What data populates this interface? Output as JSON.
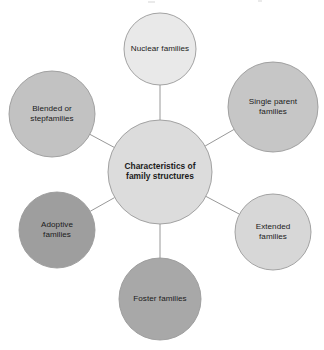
{
  "diagram": {
    "type": "radial-hub-and-spoke",
    "background_color": "#ffffff",
    "connector_color": "#8c8c8c",
    "node_border_color": "#9a9a9a",
    "center": {
      "id": "center",
      "label": "Characteristics of\nfamily structures",
      "label_plain": "Characteristics of family structures",
      "fill": "#dcdcdc",
      "cx": 160,
      "cy": 172,
      "r": 52,
      "text_color": "#1b1b1b",
      "bold": true
    },
    "nodes": [
      {
        "id": "nuclear",
        "label": "Nuclear families",
        "fill": "#e9e9e9",
        "cx": 160,
        "cy": 49,
        "r": 36,
        "position": "top"
      },
      {
        "id": "single-parent",
        "label": "Single parent\nfamilies",
        "label_plain": "Single parent families",
        "fill": "#c6c6c6",
        "cx": 273,
        "cy": 107,
        "r": 45,
        "position": "top-right"
      },
      {
        "id": "extended",
        "label": "Extended\nfamilies",
        "label_plain": "Extended families",
        "fill": "#d7d7d7",
        "cx": 273,
        "cy": 232,
        "r": 38,
        "position": "bottom-right"
      },
      {
        "id": "foster",
        "label": "Foster families",
        "fill": "#a8a8a8",
        "cx": 160,
        "cy": 299,
        "r": 41,
        "position": "bottom"
      },
      {
        "id": "adoptive",
        "label": "Adoptive\nfamilies",
        "label_plain": "Adoptive families",
        "fill": "#9e9e9e",
        "cx": 57,
        "cy": 230,
        "r": 38,
        "position": "bottom-left"
      },
      {
        "id": "blended",
        "label": "Blended or\nstepfamilies",
        "label_plain": "Blended or stepfamilies",
        "fill": "#c2c2c2",
        "cx": 52,
        "cy": 114,
        "r": 43,
        "position": "top-left"
      }
    ]
  }
}
